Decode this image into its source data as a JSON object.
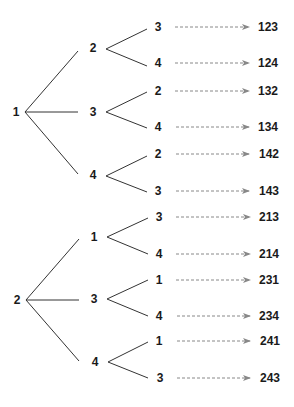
{
  "diagram": {
    "type": "tree-diagram",
    "colors": {
      "line": "#333333",
      "arrow": "#888888",
      "text": "#1a1a1a"
    },
    "trees": [
      {
        "root": "1",
        "branches": [
          {
            "label": "2",
            "leaves": [
              {
                "label": "3",
                "result": "123"
              },
              {
                "label": "4",
                "result": "124"
              }
            ]
          },
          {
            "label": "3",
            "leaves": [
              {
                "label": "2",
                "result": "132"
              },
              {
                "label": "4",
                "result": "134"
              }
            ]
          },
          {
            "label": "4",
            "leaves": [
              {
                "label": "2",
                "result": "142"
              },
              {
                "label": "3",
                "result": "143"
              }
            ]
          }
        ]
      },
      {
        "root": "2",
        "branches": [
          {
            "label": "1",
            "leaves": [
              {
                "label": "3",
                "result": "213"
              },
              {
                "label": "4",
                "result": "214"
              }
            ]
          },
          {
            "label": "3",
            "leaves": [
              {
                "label": "1",
                "result": "231"
              },
              {
                "label": "4",
                "result": "234"
              }
            ]
          },
          {
            "label": "4",
            "leaves": [
              {
                "label": "1",
                "result": "241"
              },
              {
                "label": "3",
                "result": "243"
              }
            ]
          }
        ]
      }
    ]
  }
}
